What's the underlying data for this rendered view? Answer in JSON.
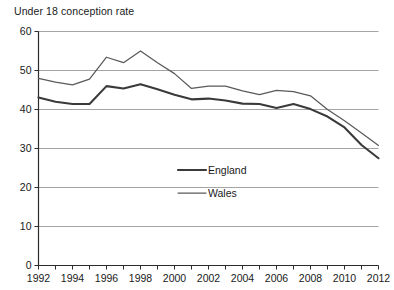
{
  "chart_data": {
    "type": "line",
    "title": "Under 18 conception rate",
    "xlabel": "",
    "ylabel": "",
    "xlim": [
      1992,
      2012
    ],
    "ylim": [
      0,
      60
    ],
    "grid": true,
    "legend_position": "center",
    "x": [
      1992,
      1993,
      1994,
      1995,
      1996,
      1997,
      1998,
      1999,
      2000,
      2001,
      2002,
      2003,
      2004,
      2005,
      2006,
      2007,
      2008,
      2009,
      2010,
      2011,
      2012
    ],
    "xticks": [
      1992,
      1994,
      1996,
      1998,
      2000,
      2002,
      2004,
      2006,
      2008,
      2010,
      2012
    ],
    "xtick_labels": [
      "1992",
      "1994",
      "1996",
      "1998",
      "2000",
      "2002",
      "2004",
      "2006",
      "2008",
      "2010",
      "2012"
    ],
    "yticks": [
      0,
      10,
      20,
      30,
      40,
      50,
      60
    ],
    "ytick_labels": [
      "0",
      "10",
      "20",
      "30",
      "40",
      "50",
      "60"
    ],
    "series": [
      {
        "name": "England",
        "values": [
          43.1,
          42.0,
          41.4,
          41.4,
          46.0,
          45.4,
          46.5,
          45.2,
          43.8,
          42.6,
          42.8,
          42.3,
          41.5,
          41.4,
          40.4,
          41.4,
          40.1,
          38.2,
          35.4,
          30.9,
          27.5
        ]
      },
      {
        "name": "Wales",
        "values": [
          48.0,
          47.0,
          46.3,
          47.8,
          53.4,
          52.0,
          55.0,
          52.0,
          49.2,
          45.4,
          46.0,
          46.0,
          44.8,
          43.8,
          44.9,
          44.6,
          43.5,
          40.0,
          37.1,
          34.0,
          30.8
        ]
      }
    ],
    "legend": [
      {
        "label": "England"
      },
      {
        "label": "Wales"
      }
    ]
  },
  "colors": {
    "england_line": "#3a3a3a",
    "wales_line": "#5a5a5a",
    "gridline": "#9a9a9a",
    "axis": "#2b2b2b",
    "text": "#1a1a1a",
    "background": "#ffffff"
  }
}
